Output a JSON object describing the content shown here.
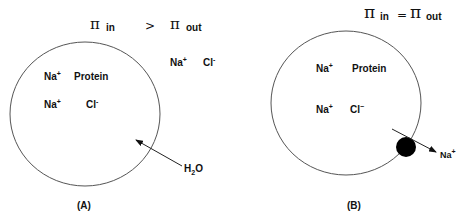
{
  "panel_a": {
    "equation": {
      "pi_symbol": "π",
      "left_sub": "in",
      "relation": ">",
      "right_sub": "out"
    },
    "outside_ions": {
      "na": "Na",
      "na_charge": "+",
      "cl": "Cl",
      "cl_charge": "-"
    },
    "inside": {
      "row1_na": "Na",
      "row1_na_charge": "+",
      "row1_protein": "Protein",
      "row2_na": "Na",
      "row2_na_charge": "+",
      "row2_cl": "Cl",
      "row2_cl_charge": "-"
    },
    "flow_label": {
      "h": "H",
      "sub": "2",
      "o": "O"
    },
    "caption": "(A)"
  },
  "panel_b": {
    "equation": {
      "pi_symbol": "π",
      "left_sub": "in",
      "relation": "=",
      "right_sub": "out"
    },
    "inside": {
      "row1_na": "Na",
      "row1_na_charge": "+",
      "row1_protein": "Protein",
      "row2_na": "Na",
      "row2_na_charge": "+",
      "row2_cl": "Cl",
      "row2_cl_charge": "−"
    },
    "flow_label": {
      "na": "Na",
      "na_charge": "+"
    },
    "caption": "(B)"
  },
  "colors": {
    "stroke": "#555555",
    "text": "#111111",
    "pump": "#000000"
  }
}
